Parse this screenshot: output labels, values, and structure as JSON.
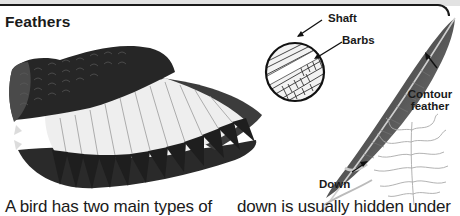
{
  "page": {
    "title": "Feathers",
    "colors": {
      "ink": "#1a1a1a",
      "top_strip": "#e2e2e2",
      "background": "#ffffff"
    }
  },
  "illustration": {
    "wing": {
      "icon": "bird-wing-illustration"
    },
    "inset": {
      "icon": "feather-magnified-circle",
      "labels": {
        "shaft": "Shaft",
        "barbs": "Barbs"
      }
    },
    "contour_feather": {
      "icon": "contour-feather-illustration",
      "label": "Contour feather",
      "label_line1": "Contour",
      "label_line2": "feather"
    },
    "down_feather": {
      "icon": "down-feather-illustration",
      "label": "Down"
    }
  },
  "body": {
    "column_left": "A bird has two main types of",
    "column_right": "down is usually hidden under"
  }
}
